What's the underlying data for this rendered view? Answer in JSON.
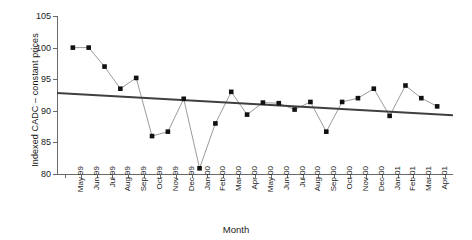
{
  "chart_data": {
    "type": "line",
    "title": "",
    "xlabel": "Month",
    "ylabel": "Indexed CADC – constant prices",
    "categories": [
      "May 99",
      "Jun 99",
      "Jul 99",
      "Aug 99",
      "Sep 99",
      "Oct 99",
      "Nov 99",
      "Dec 99",
      "Jan 00",
      "Feb 00",
      "Mar 00",
      "Apr 00",
      "May 00",
      "Jun 00",
      "Jul 00",
      "Aug 00",
      "Sep 00",
      "Oct 00",
      "Nov 00",
      "Dec 00",
      "Jan 01",
      "Feb 01",
      "Mar 01",
      "Apr 01"
    ],
    "values": [
      100,
      100,
      97,
      93.5,
      95.2,
      86,
      86.7,
      91.9,
      80.9,
      88,
      93,
      89.4,
      91.3,
      91.2,
      90.2,
      91.4,
      86.7,
      91.4,
      92,
      93.5,
      89.2,
      94,
      92,
      90.7
    ],
    "series": [
      {
        "name": "Indexed CADC – constant prices",
        "values": [
          100,
          100,
          97,
          93.5,
          95.2,
          86,
          86.7,
          91.9,
          80.9,
          88,
          93,
          89.4,
          91.3,
          91.2,
          90.2,
          91.4,
          86.7,
          91.4,
          92,
          93.5,
          89.2,
          94,
          92,
          90.7
        ],
        "marker": "square",
        "marker_color": "#111111",
        "line_color": "#808080"
      },
      {
        "name": "linear trendline",
        "type": "trendline",
        "start_value": 92.8,
        "end_value": 89.3,
        "line_color": "#404040"
      }
    ],
    "ylim": [
      80,
      105
    ],
    "yticks": [
      80,
      85,
      90,
      95,
      100,
      105
    ],
    "ytick_labels": [
      "80",
      "85",
      "90",
      "95",
      "100",
      "105"
    ],
    "grid": false,
    "legend": false,
    "legend_position": "none"
  }
}
